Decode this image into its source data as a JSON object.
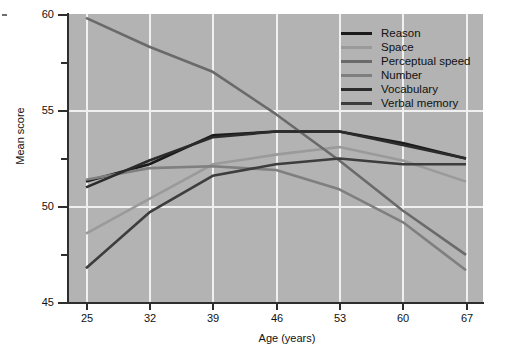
{
  "chart_data": {
    "type": "line",
    "title": "",
    "xlabel": "Age (years)",
    "ylabel": "Mean score",
    "x": [
      25,
      32,
      39,
      46,
      53,
      60,
      67
    ],
    "xticklabels": [
      "25",
      "32",
      "39",
      "46",
      "53",
      "60",
      "67"
    ],
    "xlim": [
      21.5,
      70.5
    ],
    "ylim": [
      45,
      60
    ],
    "yticks": [
      45,
      50,
      55,
      60
    ],
    "yticklabels": [
      "45",
      "50",
      "55",
      "60"
    ],
    "yminorticks": [
      47.5,
      52.5,
      57.5
    ],
    "grid": "horizontal-and-vertical, white gridlines at major ticks",
    "plot_background": "#b3b3b3",
    "legend_position": "top-right inside axes",
    "series": [
      {
        "name": "Reason",
        "color": "#1a1a1a",
        "values": [
          51.3,
          52.2,
          53.7,
          53.9,
          53.9,
          53.3,
          52.5
        ]
      },
      {
        "name": "Space",
        "color": "#9a9a9a",
        "values": [
          48.6,
          50.4,
          52.2,
          52.7,
          53.1,
          52.4,
          51.3
        ]
      },
      {
        "name": "Perceptual speed",
        "color": "#6a6a6a",
        "values": [
          59.8,
          58.3,
          57.0,
          54.8,
          52.4,
          49.8,
          47.5
        ]
      },
      {
        "name": "Number",
        "color": "#7f7f7f",
        "values": [
          51.4,
          52.0,
          52.1,
          51.9,
          50.9,
          49.2,
          46.7
        ]
      },
      {
        "name": "Vocabulary",
        "color": "#2b2b2b",
        "values": [
          51.0,
          52.4,
          53.6,
          53.9,
          53.9,
          53.2,
          52.5
        ]
      },
      {
        "name": "Verbal memory",
        "color": "#3d3d3d",
        "values": [
          46.8,
          49.7,
          51.6,
          52.2,
          52.5,
          52.2,
          52.2
        ]
      }
    ]
  },
  "legend": {
    "items": [
      {
        "label": "Reason"
      },
      {
        "label": "Space"
      },
      {
        "label": "Perceptual speed"
      },
      {
        "label": "Number"
      },
      {
        "label": "Vocabulary"
      },
      {
        "label": "Verbal memory"
      }
    ]
  },
  "axes": {
    "y_title": "Mean score",
    "x_title": "Age (years)",
    "y_labels": [
      "60",
      "55",
      "50",
      "45"
    ],
    "x_labels": [
      "25",
      "32",
      "39",
      "46",
      "53",
      "60",
      "67"
    ]
  }
}
